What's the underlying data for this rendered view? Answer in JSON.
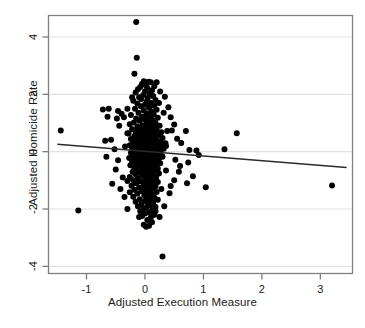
{
  "chart_data": {
    "type": "scatter",
    "title": "",
    "xlabel": "Adjusted Execution Measure",
    "ylabel": "Adjusted Homicide Rate",
    "xlim": [
      -1.65,
      3.55
    ],
    "ylim": [
      -4.25,
      4.75
    ],
    "xticks": [
      -1,
      0,
      1,
      2,
      3
    ],
    "xtick_labels": [
      "-1",
      "0",
      "1",
      "2",
      "3"
    ],
    "yticks": [
      4,
      2,
      0,
      -2,
      -4
    ],
    "ytick_labels": [
      "4",
      "2",
      "0",
      "-2",
      "-4"
    ],
    "grid": "horizontal",
    "grid_color": "#e2e2e2",
    "frame_color": "#7f7f7f",
    "point_color": "#000000",
    "point_radius": 3.0,
    "legend": "none",
    "fit_line": {
      "name": "regression-line",
      "color": "#2b2b2b",
      "x_start": -1.5,
      "y_start": 0.26,
      "x_end": 3.45,
      "y_end": -0.55,
      "slope": -0.164,
      "intercept": 0.015
    },
    "points": [
      [
        -0.15,
        4.52
      ],
      [
        -0.14,
        3.28
      ],
      [
        -0.18,
        2.72
      ],
      [
        -0.02,
        2.46
      ],
      [
        0.06,
        2.44
      ],
      [
        0.1,
        2.42
      ],
      [
        -0.05,
        2.36
      ],
      [
        0.02,
        2.3
      ],
      [
        -0.08,
        2.26
      ],
      [
        0.04,
        2.22
      ],
      [
        -0.12,
        2.18
      ],
      [
        0.12,
        2.14
      ],
      [
        0.0,
        2.1
      ],
      [
        -0.16,
        2.06
      ],
      [
        0.08,
        2.02
      ],
      [
        -0.03,
        1.98
      ],
      [
        0.14,
        1.94
      ],
      [
        -0.1,
        1.9
      ],
      [
        0.05,
        1.88
      ],
      [
        -0.06,
        1.84
      ],
      [
        0.18,
        1.8
      ],
      [
        -0.2,
        1.78
      ],
      [
        0.03,
        1.74
      ],
      [
        0.1,
        1.7
      ],
      [
        -0.13,
        1.68
      ],
      [
        0.0,
        1.64
      ],
      [
        0.16,
        1.6
      ],
      [
        -0.07,
        1.58
      ],
      [
        0.07,
        1.54
      ],
      [
        -0.17,
        1.5
      ],
      [
        -0.62,
        1.5
      ],
      [
        0.2,
        1.46
      ],
      [
        -0.02,
        1.44
      ],
      [
        -0.46,
        1.42
      ],
      [
        0.11,
        1.4
      ],
      [
        -0.11,
        1.36
      ],
      [
        0.04,
        1.33
      ],
      [
        -0.3,
        1.5
      ],
      [
        0.15,
        1.3
      ],
      [
        -0.24,
        1.28
      ],
      [
        0.02,
        1.26
      ],
      [
        -0.05,
        1.22
      ],
      [
        0.09,
        1.2
      ],
      [
        0.22,
        1.18
      ],
      [
        -0.15,
        1.16
      ],
      [
        0.0,
        1.13
      ],
      [
        -0.36,
        1.2
      ],
      [
        0.13,
        1.1
      ],
      [
        -0.09,
        1.08
      ],
      [
        0.06,
        1.05
      ],
      [
        -0.19,
        1.02
      ],
      [
        0.18,
        1.0
      ],
      [
        0.03,
        0.98
      ],
      [
        -0.26,
        0.96
      ],
      [
        0.1,
        0.94
      ],
      [
        -0.04,
        0.92
      ],
      [
        0.25,
        0.9
      ],
      [
        -0.13,
        0.88
      ],
      [
        0.01,
        0.86
      ],
      [
        0.16,
        0.84
      ],
      [
        -0.08,
        0.82
      ],
      [
        0.07,
        0.8
      ],
      [
        -0.22,
        0.78
      ],
      [
        0.2,
        0.76
      ],
      [
        -0.02,
        0.75
      ],
      [
        0.12,
        0.73
      ],
      [
        -0.16,
        0.71
      ],
      [
        0.04,
        0.69
      ],
      [
        0.28,
        0.68
      ],
      [
        -0.1,
        0.66
      ],
      [
        0.09,
        0.64
      ],
      [
        -0.28,
        0.63
      ],
      [
        0.17,
        0.61
      ],
      [
        0.0,
        0.6
      ],
      [
        -0.06,
        0.58
      ],
      [
        0.23,
        0.56
      ],
      [
        -0.18,
        0.55
      ],
      [
        0.13,
        0.53
      ],
      [
        0.05,
        0.51
      ],
      [
        -0.12,
        0.5
      ],
      [
        0.3,
        0.48
      ],
      [
        -0.01,
        0.47
      ],
      [
        0.19,
        0.45
      ],
      [
        -0.24,
        0.44
      ],
      [
        0.08,
        0.42
      ],
      [
        -0.07,
        0.41
      ],
      [
        0.15,
        0.39
      ],
      [
        0.02,
        0.38
      ],
      [
        -0.15,
        0.36
      ],
      [
        0.26,
        0.35
      ],
      [
        -0.03,
        0.34
      ],
      [
        0.11,
        0.32
      ],
      [
        -0.2,
        0.31
      ],
      [
        0.06,
        0.3
      ],
      [
        0.35,
        0.29
      ],
      [
        -0.09,
        0.28
      ],
      [
        0.21,
        0.27
      ],
      [
        0.0,
        0.26
      ],
      [
        -0.13,
        0.25
      ],
      [
        0.14,
        0.24
      ],
      [
        0.04,
        0.23
      ],
      [
        -0.26,
        0.22
      ],
      [
        0.28,
        0.21
      ],
      [
        -0.05,
        0.2
      ],
      [
        0.09,
        0.19
      ],
      [
        -0.17,
        0.18
      ],
      [
        0.18,
        0.17
      ],
      [
        0.01,
        0.16
      ],
      [
        -0.1,
        0.15
      ],
      [
        0.24,
        0.14
      ],
      [
        0.06,
        0.13
      ],
      [
        -0.22,
        0.12
      ],
      [
        0.12,
        0.11
      ],
      [
        -0.02,
        0.1
      ],
      [
        0.32,
        0.1
      ],
      [
        -0.14,
        0.09
      ],
      [
        0.16,
        0.08
      ],
      [
        0.03,
        0.07
      ],
      [
        -0.07,
        0.06
      ],
      [
        0.2,
        0.05
      ],
      [
        0.08,
        0.04
      ],
      [
        -0.19,
        0.04
      ],
      [
        0.11,
        0.03
      ],
      [
        -0.04,
        0.02
      ],
      [
        0.26,
        0.01
      ],
      [
        0.0,
        0.0
      ],
      [
        -0.12,
        -0.01
      ],
      [
        0.14,
        -0.02
      ],
      [
        0.05,
        -0.03
      ],
      [
        -0.24,
        -0.04
      ],
      [
        0.19,
        -0.05
      ],
      [
        -0.01,
        -0.06
      ],
      [
        0.1,
        -0.07
      ],
      [
        -0.16,
        -0.08
      ],
      [
        0.22,
        -0.09
      ],
      [
        0.03,
        -0.1
      ],
      [
        -0.08,
        -0.11
      ],
      [
        0.15,
        -0.12
      ],
      [
        0.07,
        -0.13
      ],
      [
        -0.2,
        -0.14
      ],
      [
        0.29,
        -0.15
      ],
      [
        -0.03,
        -0.16
      ],
      [
        0.12,
        -0.17
      ],
      [
        0.0,
        -0.18
      ],
      [
        -0.13,
        -0.19
      ],
      [
        0.18,
        -0.2
      ],
      [
        0.05,
        -0.21
      ],
      [
        -0.27,
        -0.22
      ],
      [
        0.24,
        -0.23
      ],
      [
        -0.06,
        -0.24
      ],
      [
        0.09,
        -0.25
      ],
      [
        -0.18,
        -0.26
      ],
      [
        0.14,
        -0.27
      ],
      [
        0.02,
        -0.28
      ],
      [
        -0.1,
        -0.29
      ],
      [
        0.2,
        -0.3
      ],
      [
        0.06,
        -0.32
      ],
      [
        -0.22,
        -0.33
      ],
      [
        0.16,
        -0.34
      ],
      [
        -0.02,
        -0.36
      ],
      [
        0.1,
        -0.37
      ],
      [
        -0.15,
        -0.38
      ],
      [
        0.26,
        -0.4
      ],
      [
        0.04,
        -0.41
      ],
      [
        -0.07,
        -0.43
      ],
      [
        0.13,
        -0.44
      ],
      [
        0.0,
        -0.46
      ],
      [
        -0.25,
        -0.47
      ],
      [
        0.19,
        -0.49
      ],
      [
        -0.11,
        -0.5
      ],
      [
        0.08,
        -0.52
      ],
      [
        -0.19,
        -0.53
      ],
      [
        0.15,
        -0.55
      ],
      [
        0.03,
        -0.57
      ],
      [
        -0.05,
        -0.58
      ],
      [
        0.22,
        -0.6
      ],
      [
        -0.14,
        -0.62
      ],
      [
        0.1,
        -0.63
      ],
      [
        -0.01,
        -0.65
      ],
      [
        0.17,
        -0.67
      ],
      [
        0.06,
        -0.69
      ],
      [
        -0.21,
        -0.7
      ],
      [
        0.12,
        -0.72
      ],
      [
        -0.08,
        -0.74
      ],
      [
        0.24,
        -0.76
      ],
      [
        0.02,
        -0.78
      ],
      [
        -0.16,
        -0.8
      ],
      [
        0.14,
        -0.82
      ],
      [
        -0.04,
        -0.84
      ],
      [
        0.09,
        -0.86
      ],
      [
        -0.26,
        -0.88
      ],
      [
        0.19,
        -0.9
      ],
      [
        0.0,
        -0.92
      ],
      [
        -0.12,
        -0.94
      ],
      [
        0.16,
        -0.96
      ],
      [
        0.05,
        -0.98
      ],
      [
        -0.2,
        -1.0
      ],
      [
        0.11,
        -1.02
      ],
      [
        -0.07,
        -1.04
      ],
      [
        0.22,
        -1.06
      ],
      [
        0.03,
        -1.08
      ],
      [
        -0.15,
        -1.1
      ],
      [
        0.13,
        -1.12
      ],
      [
        -0.02,
        -1.14
      ],
      [
        0.08,
        -1.17
      ],
      [
        -0.23,
        -1.19
      ],
      [
        0.18,
        -1.21
      ],
      [
        0.0,
        -1.24
      ],
      [
        -0.1,
        -1.26
      ],
      [
        0.15,
        -1.28
      ],
      [
        0.05,
        -1.31
      ],
      [
        -0.18,
        -1.33
      ],
      [
        0.1,
        -1.36
      ],
      [
        -0.05,
        -1.38
      ],
      [
        0.2,
        -1.41
      ],
      [
        0.02,
        -1.43
      ],
      [
        -0.13,
        -1.46
      ],
      [
        0.12,
        -1.49
      ],
      [
        -0.01,
        -1.52
      ],
      [
        0.07,
        -1.55
      ],
      [
        -0.2,
        -1.57
      ],
      [
        0.16,
        -1.6
      ],
      [
        0.03,
        -1.63
      ],
      [
        -0.09,
        -1.66
      ],
      [
        0.11,
        -1.69
      ],
      [
        0.0,
        -1.72
      ],
      [
        -0.16,
        -1.75
      ],
      [
        0.14,
        -1.78
      ],
      [
        0.05,
        -1.81
      ],
      [
        -0.06,
        -1.84
      ],
      [
        0.09,
        -1.87
      ],
      [
        -0.12,
        -1.9
      ],
      [
        0.18,
        -1.93
      ],
      [
        0.02,
        -1.96
      ],
      [
        -0.03,
        -2.0
      ],
      [
        0.12,
        -2.04
      ],
      [
        -0.08,
        -2.08
      ],
      [
        0.07,
        -2.12
      ],
      [
        0.0,
        -2.16
      ],
      [
        0.16,
        -2.2
      ],
      [
        -0.05,
        -2.24
      ],
      [
        0.1,
        -2.3
      ],
      [
        -0.1,
        -2.28
      ],
      [
        0.04,
        -2.38
      ],
      [
        -0.02,
        -2.55
      ],
      [
        0.02,
        -2.62
      ],
      [
        0.07,
        -2.58
      ],
      [
        -1.44,
        0.74
      ],
      [
        -1.14,
        -2.05
      ],
      [
        -0.58,
        0.42
      ],
      [
        -0.5,
        -0.62
      ],
      [
        -0.56,
        -1.12
      ],
      [
        -0.72,
        1.47
      ],
      [
        -0.64,
        1.22
      ],
      [
        -0.48,
        1.16
      ],
      [
        -0.4,
        1.32
      ],
      [
        -0.68,
        0.38
      ],
      [
        -0.44,
        0.9
      ],
      [
        -0.34,
        0.18
      ],
      [
        -0.38,
        -0.9
      ],
      [
        -0.3,
        -1.02
      ],
      [
        -0.42,
        -1.3
      ],
      [
        -0.35,
        -1.58
      ],
      [
        -0.52,
        0.08
      ],
      [
        -0.46,
        -0.3
      ],
      [
        -0.66,
        -0.18
      ],
      [
        0.34,
        1.92
      ],
      [
        0.4,
        1.55
      ],
      [
        0.44,
        1.2
      ],
      [
        0.5,
        0.95
      ],
      [
        0.38,
        0.72
      ],
      [
        0.46,
        0.74
      ],
      [
        0.55,
        0.45
      ],
      [
        0.62,
        0.3
      ],
      [
        0.7,
        0.72
      ],
      [
        0.76,
        0.06
      ],
      [
        0.88,
        0.04
      ],
      [
        0.92,
        -0.12
      ],
      [
        0.74,
        -0.38
      ],
      [
        0.82,
        -0.86
      ],
      [
        0.72,
        -1.1
      ],
      [
        1.04,
        -1.24
      ],
      [
        1.36,
        0.08
      ],
      [
        1.57,
        0.64
      ],
      [
        3.2,
        -1.18
      ],
      [
        0.3,
        -3.66
      ],
      [
        0.25,
        -2.28
      ],
      [
        0.33,
        -1.9
      ],
      [
        0.42,
        -1.45
      ],
      [
        0.5,
        -1.0
      ],
      [
        0.28,
        -1.3
      ],
      [
        0.36,
        -0.66
      ],
      [
        0.52,
        -0.28
      ],
      [
        0.6,
        -0.5
      ],
      [
        0.58,
        -0.7
      ],
      [
        0.26,
        2.1
      ],
      [
        0.2,
        2.42
      ],
      [
        0.16,
        2.28
      ],
      [
        -0.22,
        1.9
      ],
      [
        0.24,
        1.7
      ],
      [
        0.32,
        1.36
      ],
      [
        -0.3,
        0.64
      ],
      [
        0.36,
        0.2
      ],
      [
        0.3,
        -0.18
      ],
      [
        0.22,
        -1.68
      ],
      [
        0.18,
        -2.08
      ],
      [
        0.12,
        -2.46
      ],
      [
        -0.3,
        -2.0
      ],
      [
        -0.26,
        -1.42
      ],
      [
        0.44,
        -1.2
      ]
    ]
  }
}
